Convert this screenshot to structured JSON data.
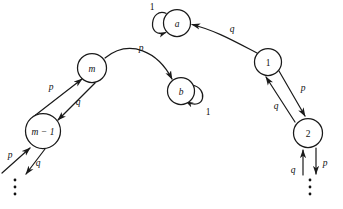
{
  "figure": {
    "type": "state-transition-diagram",
    "title": "",
    "background_color": "#ffffff",
    "stroke_color": "#1a1a1a",
    "text_color": "#111111"
  },
  "nodes": [
    {
      "id": "a",
      "label": "a",
      "style": "italic",
      "cx": 177,
      "cy": 23,
      "r": 13.5
    },
    {
      "id": "b",
      "label": "b",
      "style": "italic",
      "cx": 181,
      "cy": 91,
      "r": 13.5
    },
    {
      "id": "m",
      "label": "m",
      "style": "italic",
      "cx": 92,
      "cy": 68,
      "r": 14.5
    },
    {
      "id": "m-1",
      "label": "m − 1",
      "style": "italic",
      "cx": 43,
      "cy": 131,
      "r": 17.5
    },
    {
      "id": "1",
      "label": "1",
      "style": "normal",
      "cx": 268,
      "cy": 62,
      "r": 13.5
    },
    {
      "id": "2",
      "label": "2",
      "style": "normal",
      "cx": 308,
      "cy": 133,
      "r": 14.5
    }
  ],
  "edges": [
    {
      "id": "a-self",
      "from": "a",
      "to": "a",
      "label": "1",
      "label_style": "normal",
      "label_x": 152,
      "label_y": 7,
      "kind": "self-loop"
    },
    {
      "id": "b-self",
      "from": "b",
      "to": "b",
      "label": "1",
      "label_style": "normal",
      "label_x": 208,
      "label_y": 112,
      "kind": "self-loop"
    },
    {
      "id": "m-to-b",
      "from": "m",
      "to": "b",
      "label": "p",
      "label_style": "italic",
      "label_x": 141,
      "label_y": 48,
      "kind": "curved-arc"
    },
    {
      "id": "one-to-a",
      "from": "1",
      "to": "a",
      "label": "q",
      "label_style": "italic",
      "label_x": 232,
      "label_y": 29,
      "kind": "curved-arc"
    },
    {
      "id": "mminus1-to-m",
      "from": "m-1",
      "to": "m",
      "label": "p",
      "label_style": "italic",
      "label_x": 51,
      "label_y": 87,
      "kind": "straight"
    },
    {
      "id": "m-to-mminus1",
      "from": "m",
      "to": "m-1",
      "label": "q",
      "label_style": "italic",
      "label_x": 78,
      "label_y": 102,
      "kind": "straight"
    },
    {
      "id": "one-to-two",
      "from": "1",
      "to": "2",
      "label": "p",
      "label_style": "italic",
      "label_x": 303,
      "label_y": 88,
      "kind": "straight"
    },
    {
      "id": "two-to-one",
      "from": "2",
      "to": "1",
      "label": "q",
      "label_style": "italic",
      "label_x": 276,
      "label_y": 106,
      "kind": "straight"
    },
    {
      "id": "in-from-below-left",
      "from": "dots-left",
      "to": "m-1",
      "label": "p",
      "label_style": "italic",
      "label_x": 10,
      "label_y": 155,
      "kind": "open-in"
    },
    {
      "id": "out-to-below-left",
      "from": "m-1",
      "to": "dots-left",
      "label": "q",
      "label_style": "italic",
      "label_x": 38,
      "label_y": 163,
      "kind": "open-out"
    },
    {
      "id": "in-from-below-right",
      "from": "dots-right",
      "to": "2",
      "label": "q",
      "label_style": "italic",
      "label_x": 293,
      "label_y": 170,
      "kind": "open-in"
    },
    {
      "id": "out-to-below-right",
      "from": "2",
      "to": "dots-right",
      "label": "p",
      "label_style": "italic",
      "label_x": 325,
      "label_y": 163,
      "kind": "open-out"
    }
  ],
  "ellipses": [
    {
      "id": "dots-left",
      "x": 15,
      "y": 186,
      "orientation": "vertical",
      "count": 3
    },
    {
      "id": "dots-right",
      "x": 315,
      "y": 186,
      "orientation": "vertical",
      "count": 3
    }
  ]
}
